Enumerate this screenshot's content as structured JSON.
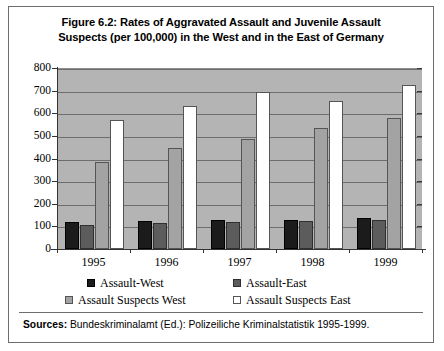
{
  "figure": {
    "title_line1": "Figure 6.2: Rates of Aggravated Assault and Juvenile Assault",
    "title_line2": "Suspects (per 100,000)  in the West and in the East of Germany",
    "sources_label": "Sources:",
    "sources_text": " Bundeskriminalamt (Ed.): Polizeiliche Kriminalstatistik 1995-1999."
  },
  "chart_data": {
    "type": "bar",
    "title": "Figure 6.2: Rates of Aggravated Assault and Juvenile Assault Suspects (per 100,000)  in the West and in the East of Germany",
    "xlabel": "",
    "ylabel": "",
    "ylim": [
      0,
      800
    ],
    "ytick_values": [
      0,
      100,
      200,
      300,
      400,
      500,
      600,
      700,
      800
    ],
    "ytick_labels": [
      "0",
      "100",
      "200",
      "300",
      "400",
      "500",
      "600",
      "700",
      "800"
    ],
    "grid": true,
    "legend_position": "below",
    "categories": [
      "1995",
      "1996",
      "1997",
      "1998",
      "1999"
    ],
    "series": [
      {
        "name": "Assault-West",
        "color": "#1b1b1b",
        "values": [
          120,
          122,
          127,
          130,
          135
        ]
      },
      {
        "name": "Assault-East",
        "color": "#5c5c5c",
        "values": [
          105,
          113,
          120,
          122,
          130
        ]
      },
      {
        "name": "Assault Suspects West",
        "color": "#a3a3a3",
        "values": [
          385,
          448,
          487,
          533,
          578
        ]
      },
      {
        "name": "Assault Suspects East",
        "color": "#ffffff",
        "values": [
          572,
          632,
          695,
          655,
          725
        ]
      }
    ]
  }
}
